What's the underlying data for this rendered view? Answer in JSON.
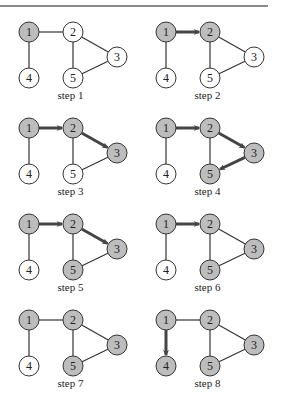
{
  "figure": {
    "nodes": [
      {
        "id": "1",
        "x": 29,
        "y": 32
      },
      {
        "id": "2",
        "x": 73,
        "y": 32
      },
      {
        "id": "3",
        "x": 117,
        "y": 57
      },
      {
        "id": "4",
        "x": 29,
        "y": 78
      },
      {
        "id": "5",
        "x": 73,
        "y": 78
      }
    ],
    "edges": [
      [
        "1",
        "2"
      ],
      [
        "1",
        "4"
      ],
      [
        "2",
        "3"
      ],
      [
        "2",
        "5"
      ],
      [
        "3",
        "5"
      ]
    ],
    "colors": {
      "visited": "#bdbdbd",
      "unvisited": "#ffffff",
      "stroke": "#333333",
      "arrow": "#444444"
    },
    "steps": [
      {
        "label": "step 1",
        "visited": [
          "1"
        ],
        "arrows": []
      },
      {
        "label": "step 2",
        "visited": [
          "1",
          "2"
        ],
        "arrows": [
          [
            "1",
            "2"
          ]
        ]
      },
      {
        "label": "step 3",
        "visited": [
          "1",
          "2",
          "3"
        ],
        "arrows": [
          [
            "1",
            "2"
          ],
          [
            "2",
            "3"
          ]
        ]
      },
      {
        "label": "step 4",
        "visited": [
          "1",
          "2",
          "3",
          "5"
        ],
        "arrows": [
          [
            "1",
            "2"
          ],
          [
            "2",
            "3"
          ],
          [
            "3",
            "5"
          ]
        ]
      },
      {
        "label": "step 5",
        "visited": [
          "1",
          "2",
          "3",
          "5"
        ],
        "arrows": [
          [
            "1",
            "2"
          ],
          [
            "2",
            "3"
          ]
        ]
      },
      {
        "label": "step 6",
        "visited": [
          "1",
          "2",
          "3",
          "5"
        ],
        "arrows": [
          [
            "1",
            "2"
          ]
        ]
      },
      {
        "label": "step 7",
        "visited": [
          "1",
          "2",
          "3",
          "5"
        ],
        "arrows": []
      },
      {
        "label": "step 8",
        "visited": [
          "1",
          "2",
          "3",
          "4",
          "5"
        ],
        "arrows": [
          [
            "1",
            "4"
          ]
        ]
      }
    ]
  }
}
